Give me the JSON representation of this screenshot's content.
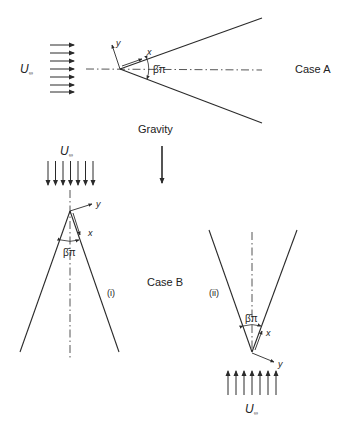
{
  "case_a": {
    "label": "Case A",
    "free_stream": "U",
    "free_stream_sub": "∞",
    "x_axis": "x",
    "y_axis": "y",
    "angle": "β̄π"
  },
  "gravity": {
    "label": "Gravity"
  },
  "case_b": {
    "label": "Case B",
    "sub_i": {
      "label": "(i)",
      "free_stream": "U",
      "free_stream_sub": "∞",
      "x_axis": "x",
      "y_axis": "y",
      "angle": "β̄π"
    },
    "sub_ii": {
      "label": "(ii)",
      "free_stream": "U",
      "free_stream_sub": "∞",
      "x_axis": "x",
      "y_axis": "y",
      "angle": "β̄π"
    }
  },
  "colors": {
    "line": "#2a2a2a",
    "background": "#ffffff"
  }
}
